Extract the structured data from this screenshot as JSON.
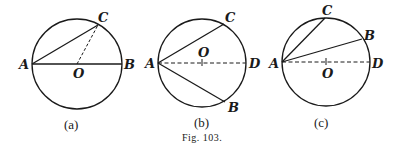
{
  "caption": "Fig. 103.",
  "figures": [
    {
      "id": "a",
      "label": "(a)",
      "points": {
        "A": "A",
        "B": "B",
        "C": "C",
        "O": "O"
      }
    },
    {
      "id": "b",
      "label": "(b)",
      "points": {
        "A": "A",
        "B": "B",
        "C": "C",
        "D": "D",
        "O": "O"
      }
    },
    {
      "id": "c",
      "label": "(c)",
      "points": {
        "A": "A",
        "B": "B",
        "C": "C",
        "D": "D",
        "O": "O"
      }
    }
  ],
  "colors": {
    "stroke": "#1a1a1a",
    "background": "#ffffff"
  }
}
